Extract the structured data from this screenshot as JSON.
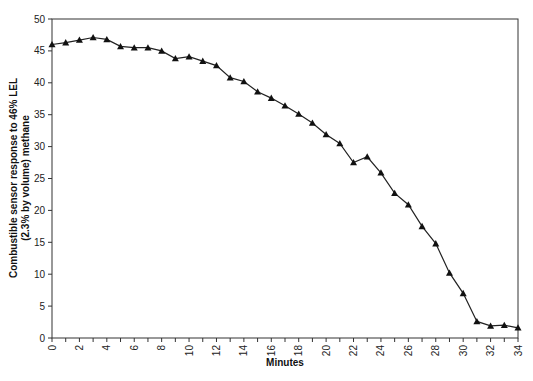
{
  "chart_data": {
    "type": "line",
    "title": "",
    "xlabel": "Minutes",
    "ylabel_line1": "Combustible sensor response to 46% LEL",
    "ylabel_line2": "(2.3% by volume) methane",
    "xlim": [
      0,
      34
    ],
    "ylim": [
      0,
      50
    ],
    "x_ticks": [
      0,
      2,
      4,
      6,
      8,
      10,
      12,
      14,
      16,
      18,
      20,
      22,
      24,
      26,
      28,
      30,
      32,
      34
    ],
    "y_ticks": [
      0,
      5,
      10,
      15,
      20,
      25,
      30,
      35,
      40,
      45,
      50
    ],
    "grid": false,
    "legend": null,
    "marker": "triangle",
    "line_color": "#222222",
    "x": [
      0,
      1,
      2,
      3,
      4,
      5,
      6,
      7,
      8,
      9,
      10,
      11,
      12,
      13,
      14,
      15,
      16,
      17,
      18,
      19,
      20,
      21,
      22,
      23,
      24,
      25,
      26,
      27,
      28,
      29,
      30,
      31,
      32,
      33,
      34
    ],
    "series": [
      {
        "name": "Sensor response",
        "values": [
          46.0,
          46.3,
          46.7,
          47.1,
          46.8,
          45.7,
          45.5,
          45.5,
          45.0,
          43.8,
          44.1,
          43.4,
          42.7,
          40.8,
          40.2,
          38.6,
          37.6,
          36.4,
          35.1,
          33.7,
          31.9,
          30.5,
          27.5,
          28.4,
          25.9,
          22.7,
          20.9,
          17.5,
          14.8,
          10.2,
          7.0,
          2.6,
          1.9,
          2.0,
          1.6
        ]
      }
    ]
  }
}
